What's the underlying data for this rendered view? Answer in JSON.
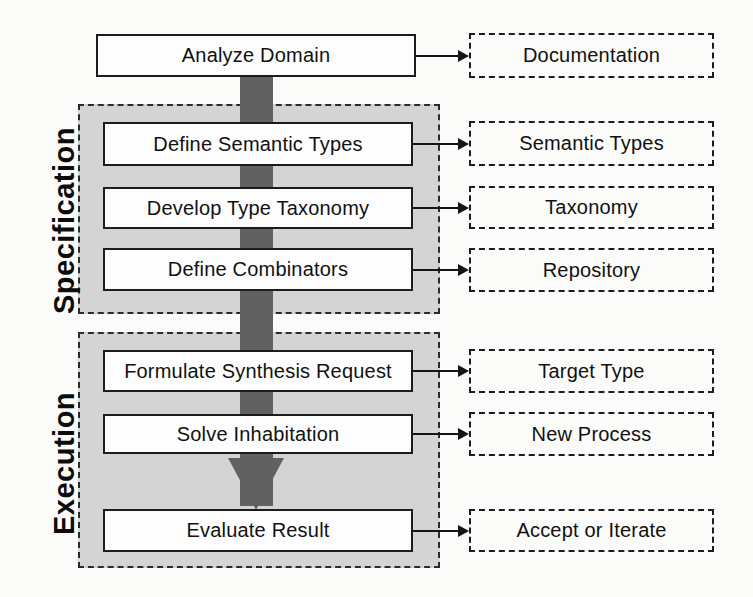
{
  "diagram": {
    "colors": {
      "panel_fill": "#d4d4d4",
      "panel_border": "#2b2b2b",
      "activity_fill": "#fdfdfd",
      "activity_border": "#1c1c1c",
      "artifact_border": "#1c1c1c",
      "flow_arrow": "#616161",
      "connector": "#141414",
      "background": "#fbfbfa",
      "text": "#111111"
    },
    "phases": [
      {
        "id": "specification",
        "label": "Specification"
      },
      {
        "id": "execution",
        "label": "Execution"
      }
    ],
    "activities": [
      {
        "id": "analyze-domain",
        "label": "Analyze Domain",
        "phase": "none"
      },
      {
        "id": "define-semantic-types",
        "label": "Define Semantic Types",
        "phase": "specification"
      },
      {
        "id": "develop-type-taxonomy",
        "label": "Develop Type Taxonomy",
        "phase": "specification"
      },
      {
        "id": "define-combinators",
        "label": "Define Combinators",
        "phase": "specification"
      },
      {
        "id": "formulate-synthesis-request",
        "label": "Formulate Synthesis Request",
        "phase": "execution"
      },
      {
        "id": "solve-inhabitation",
        "label": "Solve Inhabitation",
        "phase": "execution"
      },
      {
        "id": "evaluate-result",
        "label": "Evaluate Result",
        "phase": "execution"
      }
    ],
    "artifacts": [
      {
        "id": "documentation",
        "label": "Documentation",
        "from": "analyze-domain"
      },
      {
        "id": "semantic-types",
        "label": "Semantic Types",
        "from": "define-semantic-types"
      },
      {
        "id": "taxonomy",
        "label": "Taxonomy",
        "from": "develop-type-taxonomy"
      },
      {
        "id": "repository",
        "label": "Repository",
        "from": "define-combinators"
      },
      {
        "id": "target-type",
        "label": "Target Type",
        "from": "formulate-synthesis-request"
      },
      {
        "id": "new-process",
        "label": "New Process",
        "from": "solve-inhabitation"
      },
      {
        "id": "accept-or-iterate",
        "label": "Accept or Iterate",
        "from": "evaluate-result"
      }
    ]
  }
}
